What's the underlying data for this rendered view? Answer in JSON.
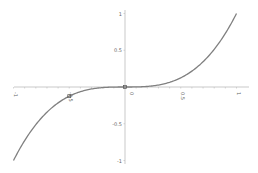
{
  "chart_data": {
    "type": "line",
    "title": "",
    "xlabel": "",
    "ylabel": "",
    "function": "y = x^3",
    "xlim": [
      -1,
      1
    ],
    "ylim": [
      -1,
      1
    ],
    "grid": false,
    "legend": null,
    "x_ticks": [
      "-1",
      "-0.5",
      "0",
      "0.5",
      "1"
    ],
    "y_ticks": [
      "1",
      "0.5",
      "0",
      "-0.5",
      "-1"
    ],
    "series": [
      {
        "name": "x^3",
        "color": "#808080",
        "x": [
          -1,
          -0.9,
          -0.8,
          -0.7,
          -0.6,
          -0.5,
          -0.4,
          -0.3,
          -0.2,
          -0.1,
          0,
          0.1,
          0.2,
          0.3,
          0.4,
          0.5,
          0.6,
          0.7,
          0.8,
          0.9,
          1
        ],
        "values": [
          -1,
          -0.729,
          -0.512,
          -0.343,
          -0.216,
          -0.125,
          -0.064,
          -0.027,
          -0.008,
          -0.001,
          0,
          0.001,
          0.008,
          0.027,
          0.064,
          0.125,
          0.216,
          0.343,
          0.512,
          0.729,
          1
        ]
      }
    ],
    "markers": [
      {
        "x": -0.5,
        "y": -0.125
      },
      {
        "x": 0,
        "y": 0
      }
    ]
  },
  "colors": {
    "axis": "#bbbbbb",
    "curve": "#808080",
    "label": "#666666"
  }
}
